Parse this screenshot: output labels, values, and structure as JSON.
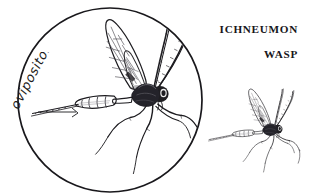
{
  "figure": {
    "kind": "scientific-line-illustration",
    "subject": "Ichneumon wasp",
    "background_color": "#ffffff",
    "ink_color": "#1d1c20",
    "title": {
      "line1": "ICHNEUMON",
      "line2": "WASP"
    },
    "callout": {
      "label": "ovipositor",
      "label_style": "handwritten-script",
      "label_rotation_degrees": -62,
      "leader_line": true
    },
    "magnifier": {
      "shape": "circle",
      "center_x": 110,
      "center_y": 100,
      "radius": 92,
      "stroke_width": 1.6,
      "contains": "enlarged-wasp"
    },
    "specimens": [
      {
        "name": "magnified-wasp",
        "scale": 1.0,
        "center_x": 112,
        "center_y": 92
      },
      {
        "name": "small-wasp",
        "scale": 0.55,
        "center_x": 252,
        "center_y": 130
      }
    ],
    "anatomy_parts": [
      "antenna",
      "head",
      "thorax",
      "forewing",
      "hindwing",
      "abdomen",
      "ovipositor",
      "foreleg",
      "midleg",
      "hindleg"
    ]
  }
}
